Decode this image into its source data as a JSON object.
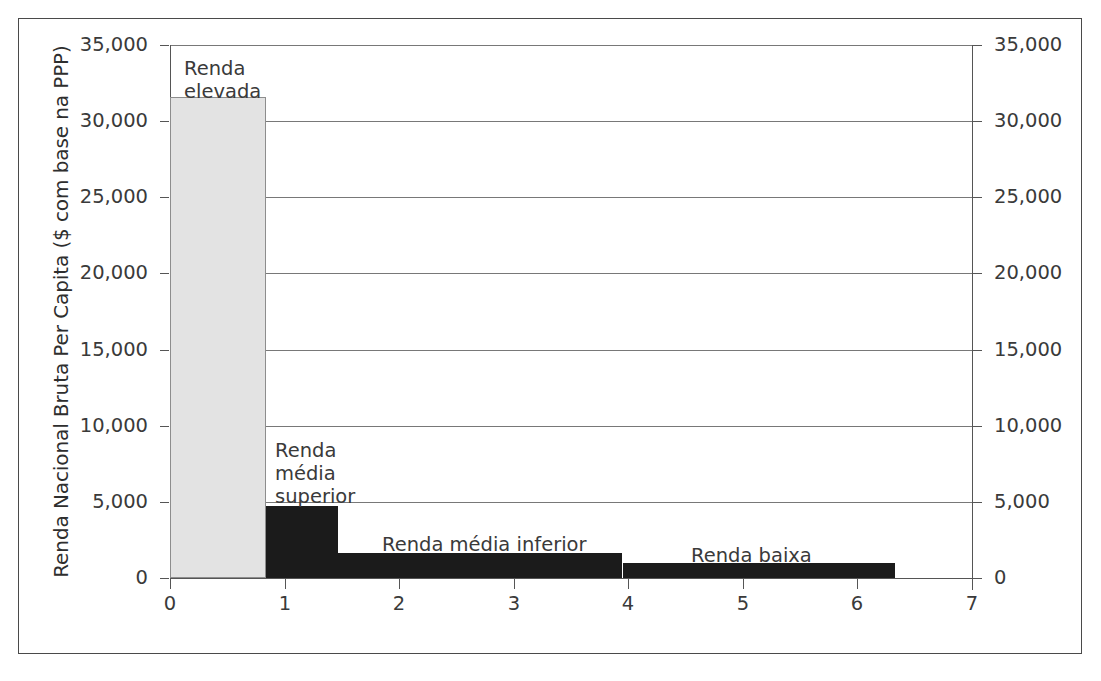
{
  "chart_data": {
    "type": "bar",
    "title": "",
    "subtitle": "",
    "xlabel": "",
    "ylabel": "Renda Nacional Bruta Per Capita ($ com base na PPP)",
    "xlim": [
      0,
      7
    ],
    "ylim": [
      0,
      35000
    ],
    "grid": true,
    "legend_position": "none",
    "orientation": "vertical",
    "note": "Stepped bar / population-weighted width chart: bar width represents share of world population, bar height represents gross national income per capita.",
    "x_ticks": [
      "0",
      "1",
      "2",
      "3",
      "4",
      "5",
      "6",
      "7"
    ],
    "x_tick_values": [
      0,
      1,
      2,
      3,
      4,
      5,
      6,
      7
    ],
    "y_ticks": [
      "0",
      "5,000",
      "10,000",
      "15,000",
      "20,000",
      "25,000",
      "30,000",
      "35,000"
    ],
    "y_tick_values": [
      0,
      5000,
      10000,
      15000,
      20000,
      25000,
      30000,
      35000
    ],
    "y_ticks_right": [
      "0",
      "5,000",
      "10,000",
      "15,000",
      "20,000",
      "25,000",
      "30,000",
      "35,000"
    ],
    "bars": [
      {
        "label": "Renda elevada",
        "label_lines": "Renda\nelevada",
        "x_start": 0.0,
        "x_end": 0.84,
        "value": 31600,
        "color": "#e3e3e3",
        "edge_color": "#8d8d8d"
      },
      {
        "label": "Renda média superior",
        "label_lines": "Renda\nmédia\nsuperior",
        "x_start": 0.84,
        "x_end": 1.47,
        "value": 4730,
        "color": "#1b1b1b",
        "edge_color": "#1b1b1b"
      },
      {
        "label": "Renda média inferior",
        "label_lines": "Renda média inferior",
        "x_start": 1.47,
        "x_end": 3.95,
        "value": 1640,
        "color": "#1b1b1b",
        "edge_color": "#1b1b1b"
      },
      {
        "label": "Renda baixa",
        "label_lines": "Renda baixa",
        "x_start": 3.95,
        "x_end": 6.32,
        "value": 985,
        "color": "#1b1b1b",
        "edge_color": "#1b1b1b"
      }
    ],
    "annotations": [
      {
        "text": "Renda\nelevada",
        "x": 0.12,
        "y": 34200
      },
      {
        "text": "Renda\nmédia\nsuperior",
        "x": 0.92,
        "y": 9100
      },
      {
        "text": "Renda média inferior",
        "x": 1.85,
        "y": 2950
      },
      {
        "text": "Renda baixa",
        "x": 4.55,
        "y": 2250
      }
    ]
  },
  "colors": {
    "high_income_fill": "#e3e3e3",
    "other_fill": "#1b1b1b",
    "gridline": "#787878",
    "axis": "#555555",
    "frame": "#4a4a4a",
    "text": "#3a3a3a",
    "background": "#ffffff"
  }
}
